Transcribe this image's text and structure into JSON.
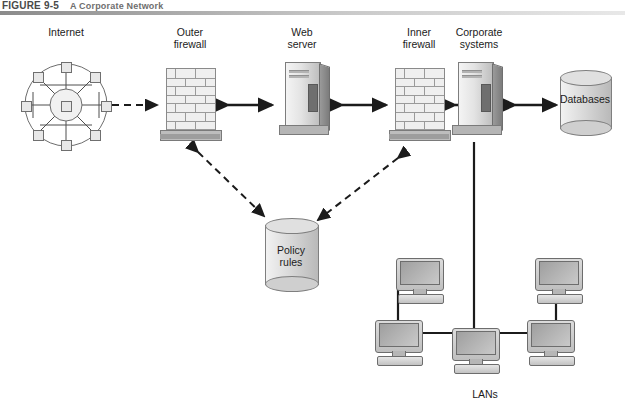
{
  "figure": {
    "number": "FIGURE 9-5",
    "title": "A Corporate Network"
  },
  "labels": {
    "internet": "Internet",
    "outer_firewall": "Outer\nfirewall",
    "web_server": "Web\nserver",
    "inner_firewall": "Inner\nfirewall",
    "corporate_systems": "Corporate\nsystems",
    "databases": "Databases",
    "policy_rules": "Policy\nrules",
    "lans": "LANs"
  },
  "nodes": [
    {
      "id": "internet",
      "kind": "cloud-network-icon",
      "label": "Internet"
    },
    {
      "id": "outer-firewall",
      "kind": "brick-wall-icon",
      "label": "Outer firewall"
    },
    {
      "id": "web-server",
      "kind": "server-tower-icon",
      "label": "Web server"
    },
    {
      "id": "inner-firewall",
      "kind": "brick-wall-icon",
      "label": "Inner firewall"
    },
    {
      "id": "corporate-systems",
      "kind": "server-tower-icon",
      "label": "Corporate systems"
    },
    {
      "id": "databases",
      "kind": "cylinder-database-icon",
      "label": "Databases"
    },
    {
      "id": "policy-rules",
      "kind": "cylinder-database-icon",
      "label": "Policy rules"
    },
    {
      "id": "lans",
      "kind": "workstation-group",
      "label": "LANs"
    }
  ],
  "connections": [
    {
      "from": "internet",
      "to": "outer-firewall",
      "style": "dashed",
      "arrows": "both"
    },
    {
      "from": "outer-firewall",
      "to": "web-server",
      "style": "solid",
      "arrows": "both"
    },
    {
      "from": "web-server",
      "to": "inner-firewall",
      "style": "solid",
      "arrows": "both"
    },
    {
      "from": "inner-firewall",
      "to": "corporate-systems",
      "style": "solid",
      "arrows": "both"
    },
    {
      "from": "corporate-systems",
      "to": "databases",
      "style": "solid",
      "arrows": "both"
    },
    {
      "from": "outer-firewall",
      "to": "policy-rules",
      "style": "dashed",
      "arrows": "both"
    },
    {
      "from": "inner-firewall",
      "to": "policy-rules",
      "style": "dashed",
      "arrows": "both"
    },
    {
      "from": "corporate-systems",
      "to": "lans",
      "style": "solid",
      "arrows": "none"
    }
  ],
  "colors": {
    "line": "#1b1b1b",
    "device_fill": "#e2e2e2",
    "device_stroke": "#7d7d7d",
    "rule_dark": "#8b8b8b",
    "text": "#1b1b1b"
  }
}
